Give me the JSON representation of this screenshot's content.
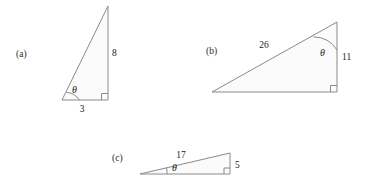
{
  "figure": {
    "type": "right-triangle-diagram-set",
    "background_color": "#ffffff",
    "stroke_color": "#8a8a8a",
    "fill_color": "#fbfbfb",
    "text_color": "#1c1c1c",
    "angle_symbol": "θ",
    "triangles": [
      {
        "id": "a",
        "label": "(a)",
        "orientation": "tall-narrow, right angle at bottom-right",
        "theta_symbol": "θ",
        "theta_vertex": "bottom-left",
        "sides": {
          "vertical_label": "8",
          "horizontal_label": "3",
          "vertical_value": 8,
          "horizontal_value": 3
        },
        "right_angle_marked": true
      },
      {
        "id": "b",
        "label": "(b)",
        "orientation": "wide, right angle at bottom-right",
        "theta_symbol": "θ",
        "theta_vertex": "top-right",
        "sides": {
          "hypotenuse_label": "26",
          "vertical_label": "11",
          "hypotenuse_value": 26,
          "vertical_value": 11
        },
        "right_angle_marked": true
      },
      {
        "id": "c",
        "label": "(c)",
        "orientation": "very shallow, right angle at bottom-right",
        "theta_symbol": "θ",
        "theta_vertex": "bottom-left",
        "sides": {
          "hypotenuse_label": "17",
          "vertical_label": "5",
          "hypotenuse_value": 17,
          "vertical_value": 5
        },
        "right_angle_marked": true
      }
    ]
  }
}
